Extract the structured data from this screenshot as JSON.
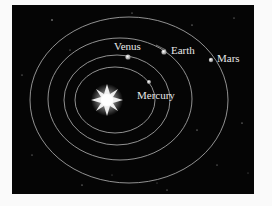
{
  "diagram": {
    "title": "",
    "background": "#050505",
    "orbit_color": "#9a9a9a",
    "sun": {
      "name": "Sun",
      "x": 95,
      "y": 95
    },
    "planets": [
      {
        "name": "Mercury",
        "label": "Mercury"
      },
      {
        "name": "Venus",
        "label": "Venus"
      },
      {
        "name": "Earth",
        "label": "Earth"
      },
      {
        "name": "Mars",
        "label": "Mars"
      }
    ]
  }
}
